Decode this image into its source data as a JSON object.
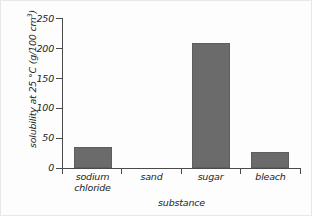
{
  "chart_data": {
    "type": "bar",
    "title": "",
    "subtitle": "",
    "xlabel": "substance",
    "ylabel": "solubility at 25 °C (g/100 cm³)",
    "categories": [
      "sodium chloride",
      "sand",
      "sugar",
      "bleach"
    ],
    "values": [
      35,
      0,
      210,
      27
    ],
    "series": [
      {
        "name": "solubility",
        "values": [
          35,
          0,
          210,
          27
        ]
      }
    ],
    "ylim": [
      0,
      250
    ],
    "yticks": [
      0,
      50,
      100,
      150,
      200,
      250
    ],
    "ytick_labels": [
      "0",
      "50",
      "100",
      "150",
      "200",
      "250"
    ],
    "grid": false,
    "legend": false,
    "legend_position": "none",
    "bar_color": "#6b6b6b",
    "axis_color": "#4a4a4a",
    "background_color": "#fdfdfd",
    "annotations": []
  },
  "axis": {
    "y_label_parts": {
      "prefix": "solubility at 25 °C (g/100 cm",
      "superscript": "3",
      "suffix": ")"
    },
    "x_title": "substance"
  },
  "categories_display": [
    {
      "line1": "sodium",
      "line2": "chloride"
    },
    {
      "line1": "sand",
      "line2": ""
    },
    {
      "line1": "sugar",
      "line2": ""
    },
    {
      "line1": "bleach",
      "line2": ""
    }
  ],
  "ticks": {
    "y": [
      "250",
      "200",
      "150",
      "100",
      "50",
      "0"
    ]
  }
}
